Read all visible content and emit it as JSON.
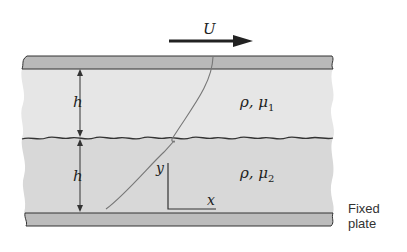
{
  "diagram": {
    "velocity_label": "U",
    "layer_top": {
      "thickness_label": "h",
      "property_label": "ρ, μ",
      "subscript": "1"
    },
    "layer_bottom": {
      "thickness_label": "h",
      "property_label": "ρ, μ",
      "subscript": "2"
    },
    "axis_y_label": "y",
    "axis_x_label": "x",
    "fixed_plate_label_line1": "Fixed",
    "fixed_plate_label_line2": "plate",
    "colors": {
      "plate": "#b8b8b8",
      "fluid_top": "#e6e6e6",
      "fluid_bottom": "#d6d6d6",
      "stroke": "#333333"
    }
  }
}
